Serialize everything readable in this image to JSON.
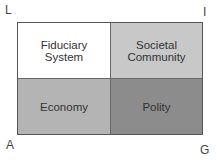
{
  "corners": {
    "top_left": "L",
    "top_right": "I",
    "bottom_left": "A",
    "bottom_right": "G"
  },
  "cells": [
    {
      "label": "Fiduciary\nSystem",
      "color": "#ffffff"
    },
    {
      "label": "Societal\nCommunity",
      "color": "#c8c8c8"
    },
    {
      "label": "Economy",
      "color": "#b4b4b4"
    },
    {
      "label": "Polity",
      "color": "#8c8c8c"
    }
  ]
}
